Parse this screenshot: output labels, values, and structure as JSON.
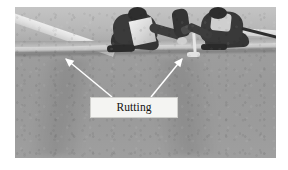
{
  "figure": {
    "type": "annotated-photograph",
    "color_mode": "grayscale"
  },
  "photo": {
    "alt": "grayscale photograph of a road surface with a kerb line and two workers",
    "background_color": "#9a9a9a",
    "kerb_color": "#c9c7c0",
    "paint_marking_color": "#eeeeec",
    "worker_clothing_color": "#353535"
  },
  "annotations": {
    "label": {
      "text": "Rutting",
      "box_fill": "#f4f4f2",
      "box_border": "#cfcfcc",
      "text_color": "#111111"
    },
    "arrows": [
      {
        "name": "left-rut-arrow",
        "direction": "up-left",
        "tip_x": 64,
        "tip_y": 57,
        "tail_x": 112,
        "tail_y": 97,
        "color": "#ffffff"
      },
      {
        "name": "right-rut-arrow",
        "direction": "up-right",
        "tip_x": 184,
        "tip_y": 57,
        "tail_x": 150,
        "tail_y": 97,
        "color": "#ffffff"
      }
    ]
  }
}
